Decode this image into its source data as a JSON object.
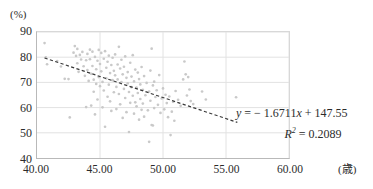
{
  "chart_data": {
    "type": "scatter",
    "title": "",
    "xlabel": "(歳)",
    "ylabel": "(%)",
    "xlim": [
      40,
      60
    ],
    "ylim": [
      40,
      90
    ],
    "xticks": [
      "40.00",
      "45.00",
      "50.00",
      "55.00",
      "60.00"
    ],
    "xtick_values": [
      40,
      45,
      50,
      55,
      60
    ],
    "yticks": [
      "90",
      "80",
      "70",
      "60",
      "50",
      "40"
    ],
    "ytick_values": [
      90,
      80,
      70,
      60,
      50,
      40
    ],
    "grid": true,
    "legend": "none",
    "marker_color": "#c9c9c9",
    "trendline_color": "#3a3a3a",
    "annotations": {
      "equation": "y = − 1.6711x + 147.55",
      "r_squared": "R² = 0.2089",
      "equation_parts": {
        "y_var": "y",
        "equals": "=",
        "slope": "− 1.6711",
        "x_var": "x",
        "plus": "+",
        "intercept": "147.55"
      },
      "r2_parts": {
        "r_var": "R",
        "exponent": "2",
        "equals": "=",
        "value": "0.2089"
      }
    },
    "trendline": {
      "type": "linear",
      "slope": -1.6711,
      "intercept": 147.55,
      "x_start": 40.6,
      "x_end": 55.9,
      "style": "dashed"
    },
    "points": [
      [
        40.6,
        85.6
      ],
      [
        40.7,
        79.9
      ],
      [
        40.8,
        77.2
      ],
      [
        41.6,
        78.5
      ],
      [
        41.9,
        76.3
      ],
      [
        42.2,
        71.4
      ],
      [
        42.5,
        71.3
      ],
      [
        42.6,
        56.1
      ],
      [
        42.9,
        81.8
      ],
      [
        43.0,
        84.4
      ],
      [
        43.1,
        80.5
      ],
      [
        43.2,
        77.6
      ],
      [
        43.2,
        83.3
      ],
      [
        43.3,
        74.2
      ],
      [
        43.4,
        80.9
      ],
      [
        43.5,
        79.1
      ],
      [
        43.6,
        82.1
      ],
      [
        43.7,
        76.4
      ],
      [
        43.8,
        72.6
      ],
      [
        43.9,
        78.8
      ],
      [
        43.9,
        60.2
      ],
      [
        44.0,
        81.3
      ],
      [
        44.0,
        74.9
      ],
      [
        44.1,
        70.6
      ],
      [
        44.2,
        79.2
      ],
      [
        44.2,
        83.0
      ],
      [
        44.3,
        73.4
      ],
      [
        44.3,
        60.8
      ],
      [
        44.4,
        76.5
      ],
      [
        44.4,
        82.2
      ],
      [
        44.5,
        71.1
      ],
      [
        44.5,
        66.3
      ],
      [
        44.6,
        80.1
      ],
      [
        44.6,
        57.3
      ],
      [
        44.7,
        75.2
      ],
      [
        44.7,
        69.4
      ],
      [
        44.8,
        78.6
      ],
      [
        44.8,
        63.2
      ],
      [
        44.9,
        82.9
      ],
      [
        44.9,
        72.1
      ],
      [
        45.0,
        77.3
      ],
      [
        45.0,
        68.5
      ],
      [
        45.1,
        81.7
      ],
      [
        45.1,
        74.4
      ],
      [
        45.2,
        70.2
      ],
      [
        45.2,
        60.1
      ],
      [
        45.3,
        79.4
      ],
      [
        45.3,
        66.8
      ],
      [
        45.4,
        82.4
      ],
      [
        45.4,
        52.4
      ],
      [
        45.5,
        75.8
      ],
      [
        45.5,
        71.6
      ],
      [
        45.6,
        78.2
      ],
      [
        45.6,
        64.3
      ],
      [
        45.7,
        80.6
      ],
      [
        45.7,
        69.1
      ],
      [
        45.8,
        73.7
      ],
      [
        45.8,
        62.5
      ],
      [
        45.9,
        76.9
      ],
      [
        45.9,
        58.7
      ],
      [
        46.0,
        79.8
      ],
      [
        46.0,
        70.9
      ],
      [
        46.1,
        74.6
      ],
      [
        46.1,
        66.1
      ],
      [
        46.2,
        81.1
      ],
      [
        46.2,
        72.8
      ],
      [
        46.3,
        68.2
      ],
      [
        46.3,
        59.4
      ],
      [
        46.4,
        77.1
      ],
      [
        46.4,
        71.2
      ],
      [
        46.5,
        84.1
      ],
      [
        46.5,
        65.4
      ],
      [
        46.6,
        75.5
      ],
      [
        46.6,
        61.3
      ],
      [
        46.7,
        79.0
      ],
      [
        46.7,
        70.1
      ],
      [
        46.8,
        73.2
      ],
      [
        46.8,
        55.9
      ],
      [
        46.9,
        76.2
      ],
      [
        46.9,
        67.4
      ],
      [
        47.0,
        80.3
      ],
      [
        47.0,
        63.8
      ],
      [
        47.1,
        71.8
      ],
      [
        47.1,
        58.2
      ],
      [
        47.2,
        74.1
      ],
      [
        47.2,
        69.6
      ],
      [
        47.3,
        66.2
      ],
      [
        47.3,
        50.3
      ],
      [
        47.4,
        77.8
      ],
      [
        47.4,
        61.9
      ],
      [
        47.5,
        72.3
      ],
      [
        47.5,
        68.1
      ],
      [
        47.6,
        80.8
      ],
      [
        47.6,
        64.7
      ],
      [
        47.7,
        70.4
      ],
      [
        47.7,
        57.6
      ],
      [
        47.8,
        75.1
      ],
      [
        47.8,
        62.1
      ],
      [
        47.9,
        67.9
      ],
      [
        47.9,
        60.5
      ],
      [
        48.0,
        73.9
      ],
      [
        48.0,
        65.8
      ],
      [
        48.1,
        71.3
      ],
      [
        48.1,
        55.2
      ],
      [
        48.2,
        69.2
      ],
      [
        48.2,
        63.4
      ],
      [
        48.3,
        76.1
      ],
      [
        48.3,
        59.1
      ],
      [
        48.4,
        67.1
      ],
      [
        48.4,
        61.6
      ],
      [
        48.5,
        72.5
      ],
      [
        48.5,
        56.4
      ],
      [
        48.6,
        64.9
      ],
      [
        48.7,
        69.8
      ],
      [
        48.8,
        58.9
      ],
      [
        48.9,
        66.4
      ],
      [
        48.9,
        46.4
      ],
      [
        49.0,
        74.7
      ],
      [
        49.0,
        62.7
      ],
      [
        49.1,
        83.4
      ],
      [
        49.1,
        53.1
      ],
      [
        49.2,
        68.8
      ],
      [
        49.2,
        52.9
      ],
      [
        49.3,
        70.3
      ],
      [
        49.3,
        59.8
      ],
      [
        49.4,
        64.2
      ],
      [
        49.5,
        66.9
      ],
      [
        49.6,
        61.1
      ],
      [
        49.7,
        72.9
      ],
      [
        49.8,
        57.9
      ],
      [
        49.9,
        63.6
      ],
      [
        50.0,
        67.6
      ],
      [
        50.1,
        59.3
      ],
      [
        50.2,
        65.1
      ],
      [
        50.3,
        61.8
      ],
      [
        50.4,
        56.2
      ],
      [
        50.5,
        64.4
      ],
      [
        50.6,
        49.1
      ],
      [
        50.7,
        58.4
      ],
      [
        50.8,
        62.3
      ],
      [
        50.9,
        54.8
      ],
      [
        51.0,
        66.6
      ],
      [
        51.2,
        63.1
      ],
      [
        51.4,
        60.7
      ],
      [
        51.6,
        71.2
      ],
      [
        51.7,
        78.3
      ],
      [
        51.8,
        73.2
      ],
      [
        51.9,
        64.8
      ],
      [
        52.0,
        72.1
      ],
      [
        52.1,
        67.2
      ],
      [
        52.2,
        62.6
      ],
      [
        52.4,
        61.4
      ],
      [
        53.1,
        66.4
      ],
      [
        53.4,
        63.2
      ],
      [
        55.8,
        64.1
      ]
    ]
  }
}
